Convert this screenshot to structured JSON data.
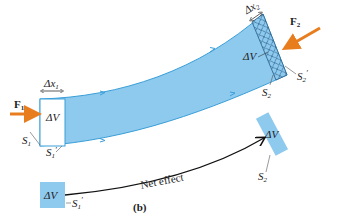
{
  "figure": {
    "panel_label": "(b)",
    "colors": {
      "fluid": "#8ec9ee",
      "fluid_edge": "#3a9fd8",
      "force_arrow": "#e87d1e",
      "text": "#222222",
      "net_arrow": "#111111"
    },
    "tube": {
      "flow_arrows": 4
    },
    "left_end": {
      "force_label": "F",
      "force_sub": "1",
      "displacement_label": "Δx",
      "displacement_sub": "1",
      "volume_label": "ΔV",
      "surface_label": "S",
      "surface_sub": "1",
      "surface_prime_label": "S",
      "surface_prime_sub": "1",
      "prime": "′"
    },
    "right_end": {
      "force_label": "F",
      "force_sub": "2",
      "displacement_label": "Δx",
      "displacement_sub": "2",
      "volume_label": "ΔV",
      "surface_label": "S",
      "surface_sub": "2",
      "surface_prime_label": "S",
      "surface_prime_sub": "2",
      "prime": "′"
    },
    "net_effect": {
      "arrow_label": "Net effect",
      "start_volume_label": "ΔV",
      "start_surface_label": "S",
      "start_surface_sub": "1",
      "end_volume_label": "ΔV",
      "end_surface_label": "S",
      "end_surface_sub": "2",
      "prime": "′"
    }
  }
}
